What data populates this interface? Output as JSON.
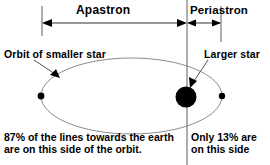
{
  "diagram": {
    "title_labels": {
      "apastron": "Apastron",
      "periastron": "Periastron"
    },
    "annotations": {
      "orbit_label": "Orbit of smaller star",
      "star_label": "Larger star"
    },
    "captions": {
      "left_line1": "87% of the lines towards the earth",
      "left_line2": "are on this side of the orbit.",
      "right_line1": "Only 13% are",
      "right_line2": "on this side"
    },
    "icons": {
      "left_arrow": "arrow-left-icon",
      "right_arrow": "arrow-right-icon",
      "orbit_pointer": "arrow-pointer-icon",
      "star_pointer": "arrow-pointer-icon",
      "larger_star": "filled-circle-icon",
      "apastron_node": "small-dot-icon",
      "periastron_node": "small-dot-icon",
      "orbit_path": "ellipse-icon",
      "focus_axis": "vertical-line-icon"
    },
    "colors": {
      "stroke": "#000000",
      "orbit_stroke": "#808080",
      "guide_stroke": "#9a9a9a",
      "background": "#ffffff",
      "star_fill": "#000000"
    },
    "measurements": {
      "apastron_percent": "87%",
      "periastron_percent": "13%"
    }
  }
}
